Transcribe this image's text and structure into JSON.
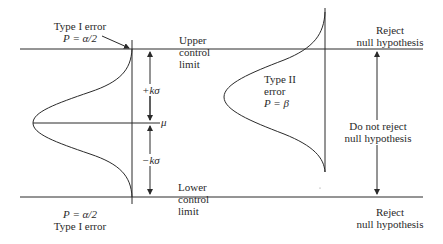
{
  "left_panel": {
    "type1_top": {
      "title": "Type I error",
      "prob": "P = α/2"
    },
    "upper_limit": {
      "line1": "Upper",
      "line2": "control",
      "line3": "limit"
    },
    "plus_k_sigma": "+kσ",
    "mean": "μ",
    "minus_k_sigma": "−kσ",
    "lower_limit": {
      "line1": "Lower",
      "line2": "control",
      "line3": "limit"
    },
    "type1_bottom": {
      "prob": "P = α/2",
      "title": "Type I error"
    }
  },
  "right_panel": {
    "reject_top": {
      "line1": "Reject",
      "line2": "null hypothesis"
    },
    "type2": {
      "line1": "Type II",
      "line2": "error",
      "line3": "P = β"
    },
    "do_not_reject": {
      "line1": "Do not reject",
      "line2": "null hypothesis"
    },
    "reject_bottom": {
      "line1": "Reject",
      "line2": "null hypothesis"
    }
  },
  "colors": {
    "line": "#2a2a2a",
    "background": "#ffffff"
  }
}
